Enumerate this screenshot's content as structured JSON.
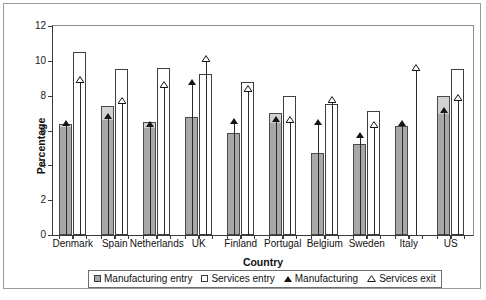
{
  "chart_data": {
    "type": "bar",
    "title": "",
    "xlabel": "Country",
    "ylabel": "Percentage",
    "ylim": [
      0,
      12
    ],
    "yticks": [
      "0",
      "2",
      "4",
      "6",
      "8",
      "10",
      "12"
    ],
    "grid": false,
    "legend_position": "bottom",
    "categories": [
      "Denmark",
      "Spain",
      "Netherlands",
      "UK",
      "Finland",
      "Portugal",
      "Belgium",
      "Sweden",
      "Italy",
      "US"
    ],
    "series": [
      {
        "name": "Manufacturing entry",
        "marker": "filled-square",
        "values": [
          6.4,
          7.4,
          6.5,
          6.8,
          5.85,
          7.0,
          4.7,
          5.2,
          6.25,
          8.0
        ]
      },
      {
        "name": "Services entry",
        "marker": "open-square",
        "values": [
          10.5,
          9.55,
          9.6,
          9.25,
          8.8,
          8.0,
          7.55,
          7.1,
          null,
          9.55
        ]
      },
      {
        "name": "Manufacturing",
        "marker": "filled-triangle",
        "values": [
          6.25,
          6.65,
          6.2,
          8.6,
          6.35,
          6.5,
          6.3,
          5.55,
          6.25,
          7.0
        ]
      },
      {
        "name": "Services exit",
        "marker": "open-triangle",
        "values": [
          8.7,
          7.5,
          8.45,
          9.95,
          8.2,
          6.45,
          7.6,
          6.15,
          9.4,
          7.7
        ]
      }
    ]
  },
  "legend": {
    "items": [
      {
        "label": "Manufacturing entry",
        "marker": "filled-square"
      },
      {
        "label": "Services entry",
        "marker": "open-square"
      },
      {
        "label": "Manufacturing",
        "marker": "filled-triangle"
      },
      {
        "label": "Services exit",
        "marker": "open-triangle"
      }
    ]
  },
  "colors": {
    "manufacturing_entry_fill": "#a8a8a8",
    "services_entry_fill": "#ffffff",
    "bar_border": "#3f3f3f",
    "marker": "#151515",
    "axis": "#3a3a3a",
    "frame": "#9a9a9a"
  }
}
